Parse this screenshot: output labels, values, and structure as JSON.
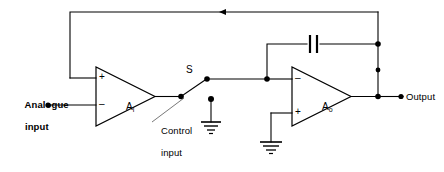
{
  "diagram": {
    "type": "schematic",
    "background_color": "#ffffff",
    "line_color": "#000000"
  },
  "labels": {
    "analogue_input_line1": "Analogue",
    "analogue_input_line2": "input",
    "control_input_line1": "Control",
    "control_input_line2": "input",
    "switch": "S",
    "output": "Output"
  },
  "amplifiers": [
    {
      "name": "input-amplifier",
      "label_main": "A",
      "label_sub": "i",
      "top_terminal_sign": "+",
      "bottom_terminal_sign": "–"
    },
    {
      "name": "output-amplifier",
      "label_main": "A",
      "label_sub": "o",
      "top_terminal_sign": "–",
      "bottom_terminal_sign": "+"
    }
  ],
  "components": {
    "capacitor": "capacitor-symbol",
    "switch": "spst-switch-symbol",
    "ground_switch_node": "ground-symbol",
    "ground_output_amp": "ground-symbol",
    "feedback_arrow": "arrow-left"
  }
}
